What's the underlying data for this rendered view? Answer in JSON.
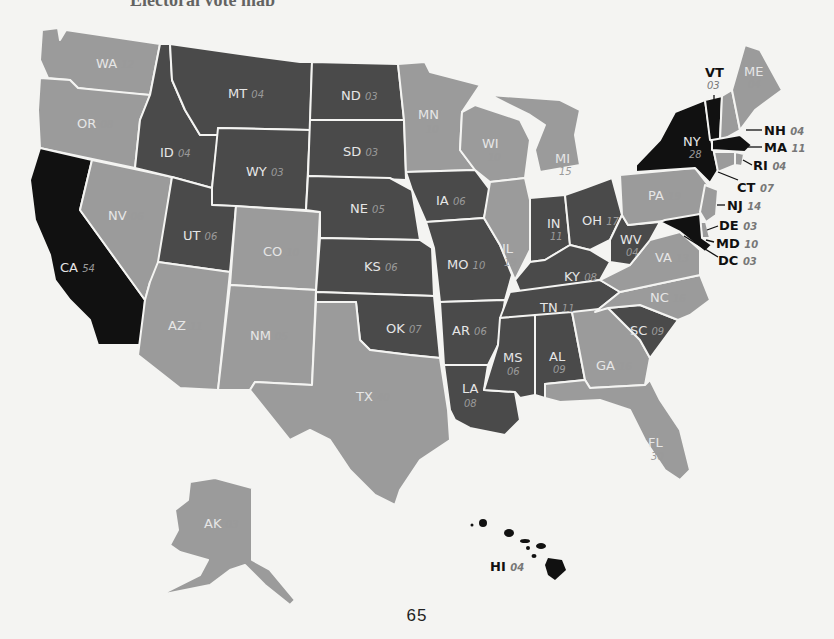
{
  "page": {
    "header_fragment": "Electoral vote map",
    "page_number": "65"
  },
  "legend_colors": {
    "black": "#111111",
    "dark": "#4a4a4a",
    "light": "#9b9b9b",
    "background": "#f4f4f2"
  },
  "states": {
    "WA": {
      "abbr": "WA",
      "votes": "12",
      "shade": "light"
    },
    "OR": {
      "abbr": "OR",
      "votes": "08",
      "shade": "light"
    },
    "CA": {
      "abbr": "CA",
      "votes": "54",
      "shade": "black"
    },
    "ID": {
      "abbr": "ID",
      "votes": "04",
      "shade": "dark"
    },
    "NV": {
      "abbr": "NV",
      "votes": "06",
      "shade": "light"
    },
    "MT": {
      "abbr": "MT",
      "votes": "04",
      "shade": "dark"
    },
    "WY": {
      "abbr": "WY",
      "votes": "03",
      "shade": "dark"
    },
    "UT": {
      "abbr": "UT",
      "votes": "06",
      "shade": "dark"
    },
    "AZ": {
      "abbr": "AZ",
      "votes": "11",
      "shade": "light"
    },
    "CO": {
      "abbr": "CO",
      "votes": "10",
      "shade": "light"
    },
    "NM": {
      "abbr": "NM",
      "votes": "05",
      "shade": "light"
    },
    "ND": {
      "abbr": "ND",
      "votes": "03",
      "shade": "dark"
    },
    "SD": {
      "abbr": "SD",
      "votes": "03",
      "shade": "dark"
    },
    "NE": {
      "abbr": "NE",
      "votes": "05",
      "shade": "dark"
    },
    "KS": {
      "abbr": "KS",
      "votes": "06",
      "shade": "dark"
    },
    "OK": {
      "abbr": "OK",
      "votes": "07",
      "shade": "dark"
    },
    "TX": {
      "abbr": "TX",
      "votes": "40",
      "shade": "light"
    },
    "MN": {
      "abbr": "MN",
      "votes": "10",
      "shade": "light"
    },
    "IA": {
      "abbr": "IA",
      "votes": "06",
      "shade": "dark"
    },
    "MO": {
      "abbr": "MO",
      "votes": "10",
      "shade": "dark"
    },
    "AR": {
      "abbr": "AR",
      "votes": "06",
      "shade": "dark"
    },
    "LA": {
      "abbr": "LA",
      "votes": "08",
      "shade": "dark"
    },
    "WI": {
      "abbr": "WI",
      "votes": "10",
      "shade": "light"
    },
    "IL": {
      "abbr": "IL",
      "votes": "19",
      "shade": "light"
    },
    "MI": {
      "abbr": "MI",
      "votes": "15",
      "shade": "light"
    },
    "IN": {
      "abbr": "IN",
      "votes": "11",
      "shade": "dark"
    },
    "OH": {
      "abbr": "OH",
      "votes": "17",
      "shade": "dark"
    },
    "KY": {
      "abbr": "KY",
      "votes": "08",
      "shade": "dark"
    },
    "TN": {
      "abbr": "TN",
      "votes": "11",
      "shade": "dark"
    },
    "MS": {
      "abbr": "MS",
      "votes": "06",
      "shade": "dark"
    },
    "AL": {
      "abbr": "AL",
      "votes": "09",
      "shade": "dark"
    },
    "GA": {
      "abbr": "GA",
      "votes": "16",
      "shade": "light"
    },
    "FL": {
      "abbr": "FL",
      "votes": "30",
      "shade": "light"
    },
    "SC": {
      "abbr": "SC",
      "votes": "09",
      "shade": "dark"
    },
    "NC": {
      "abbr": "NC",
      "votes": "16",
      "shade": "light"
    },
    "VA": {
      "abbr": "VA",
      "votes": "13",
      "shade": "light"
    },
    "WV": {
      "abbr": "WV",
      "votes": "04",
      "shade": "dark"
    },
    "PA": {
      "abbr": "PA",
      "votes": "19",
      "shade": "light"
    },
    "NY": {
      "abbr": "NY",
      "votes": "28",
      "shade": "black"
    },
    "VT": {
      "abbr": "VT",
      "votes": "03",
      "shade": "black"
    },
    "NH": {
      "abbr": "NH",
      "votes": "04",
      "shade": "light"
    },
    "ME": {
      "abbr": "ME",
      "votes": "04",
      "shade": "light"
    },
    "MA": {
      "abbr": "MA",
      "votes": "11",
      "shade": "black"
    },
    "RI": {
      "abbr": "RI",
      "votes": "04",
      "shade": "light"
    },
    "CT": {
      "abbr": "CT",
      "votes": "07",
      "shade": "light"
    },
    "NJ": {
      "abbr": "NJ",
      "votes": "14",
      "shade": "light"
    },
    "DE": {
      "abbr": "DE",
      "votes": "03",
      "shade": "light"
    },
    "MD": {
      "abbr": "MD",
      "votes": "10",
      "shade": "black"
    },
    "DC": {
      "abbr": "DC",
      "votes": "03",
      "shade": "black"
    },
    "AK": {
      "abbr": "AK",
      "votes": "03",
      "shade": "light"
    },
    "HI": {
      "abbr": "HI",
      "votes": "04",
      "shade": "black"
    }
  }
}
